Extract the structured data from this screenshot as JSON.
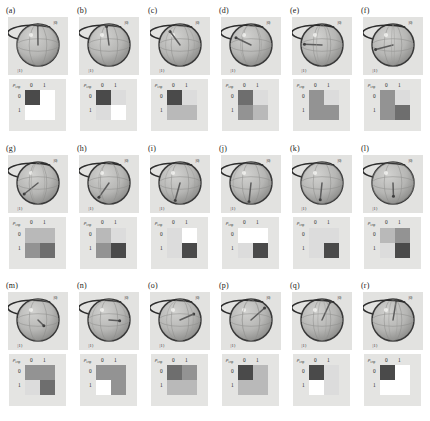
{
  "figure": {
    "type": "qubit-state-tomography-grid",
    "rows": 3,
    "columns": 6,
    "background": "#ffffff",
    "panel_background": "#e2e2e0"
  },
  "axis_labels": {
    "ket_0": "|0⟩",
    "ket_1": "|1⟩",
    "rho_symbol": "ρ",
    "rho_subscript": "exp",
    "col_0": "0",
    "col_1": "1",
    "row_0": "0",
    "row_1": "1"
  },
  "colors": {
    "cell_max": "#4a4a4a",
    "cell_high": "#6e6e6e",
    "cell_mid": "#939393",
    "cell_low": "#b9b9b9",
    "cell_faint": "#dcdcdc",
    "cell_empty": "#ffffff",
    "sphere_fill": "#b4b4b2",
    "sphere_edge": "#3a3a3a",
    "vector": "#5c5c5c",
    "panel_bg": "#e2e2e0",
    "rho_bg": "#e4e4e2"
  },
  "chart_data": {
    "type": "heatmap",
    "title": "",
    "xlabel": "",
    "ylabel": "",
    "categories": [
      "0",
      "1"
    ],
    "panels": [
      {
        "label": "(a)",
        "bloch": {
          "theta_deg": 8,
          "phi_deg": 95,
          "length": 0.96
        },
        "matrix": [
          [
            1.0,
            0.04
          ],
          [
            0.04,
            0.0
          ]
        ]
      },
      {
        "label": "(b)",
        "bloch": {
          "theta_deg": 22,
          "phi_deg": 110,
          "length": 0.95
        },
        "matrix": [
          [
            0.97,
            0.07
          ],
          [
            0.07,
            0.03
          ]
        ]
      },
      {
        "label": "(c)",
        "bloch": {
          "theta_deg": 46,
          "phi_deg": 138,
          "length": 0.93
        },
        "matrix": [
          [
            0.86,
            0.1
          ],
          [
            0.28,
            0.14
          ]
        ]
      },
      {
        "label": "(d)",
        "bloch": {
          "theta_deg": 68,
          "phi_deg": 152,
          "length": 0.92
        },
        "matrix": [
          [
            0.68,
            0.12
          ],
          [
            0.4,
            0.32
          ]
        ]
      },
      {
        "label": "(e)",
        "bloch": {
          "theta_deg": 88,
          "phi_deg": 168,
          "length": 0.9
        },
        "matrix": [
          [
            0.55,
            0.1
          ],
          [
            0.48,
            0.45
          ]
        ]
      },
      {
        "label": "(f)",
        "bloch": {
          "theta_deg": 104,
          "phi_deg": 180,
          "length": 0.9
        },
        "matrix": [
          [
            0.4,
            0.08
          ],
          [
            0.45,
            0.6
          ]
        ]
      },
      {
        "label": "(g)",
        "bloch": {
          "theta_deg": 126,
          "phi_deg": 196,
          "length": 0.89
        },
        "matrix": [
          [
            0.26,
            0.22
          ],
          [
            0.42,
            0.74
          ]
        ]
      },
      {
        "label": "(h)",
        "bloch": {
          "theta_deg": 140,
          "phi_deg": 208,
          "length": 0.89
        },
        "matrix": [
          [
            0.16,
            0.1
          ],
          [
            0.34,
            0.84
          ]
        ]
      },
      {
        "label": "(i)",
        "bloch": {
          "theta_deg": 158,
          "phi_deg": 224,
          "length": 0.9
        },
        "matrix": [
          [
            0.06,
            0.04
          ],
          [
            0.1,
            0.94
          ]
        ]
      },
      {
        "label": "(j)",
        "bloch": {
          "theta_deg": 168,
          "phi_deg": 238,
          "length": 0.91
        },
        "matrix": [
          [
            0.04,
            0.03
          ],
          [
            0.06,
            0.96
          ]
        ]
      },
      {
        "label": "(k)",
        "bloch": {
          "theta_deg": 152,
          "phi_deg": 258,
          "length": 0.9
        },
        "matrix": [
          [
            0.1,
            0.06
          ],
          [
            0.08,
            0.9
          ]
        ]
      },
      {
        "label": "(l)",
        "bloch": {
          "theta_deg": 134,
          "phi_deg": 272,
          "length": 0.9
        },
        "matrix": [
          [
            0.18,
            0.42
          ],
          [
            0.12,
            0.82
          ]
        ]
      },
      {
        "label": "(m)",
        "bloch": {
          "theta_deg": 108,
          "phi_deg": 290,
          "length": 0.9
        },
        "matrix": [
          [
            0.38,
            0.4
          ],
          [
            0.06,
            0.62
          ]
        ]
      },
      {
        "label": "(n)",
        "bloch": {
          "theta_deg": 92,
          "phi_deg": 306,
          "length": 0.91
        },
        "matrix": [
          [
            0.52,
            0.34
          ],
          [
            0.05,
            0.48
          ]
        ]
      },
      {
        "label": "(o)",
        "bloch": {
          "theta_deg": 72,
          "phi_deg": 322,
          "length": 0.92
        },
        "matrix": [
          [
            0.7,
            0.36
          ],
          [
            0.3,
            0.3
          ]
        ]
      },
      {
        "label": "(p)",
        "bloch": {
          "theta_deg": 52,
          "phi_deg": 338,
          "length": 0.93
        },
        "matrix": [
          [
            0.82,
            0.3
          ],
          [
            0.14,
            0.18
          ]
        ]
      },
      {
        "label": "(q)",
        "bloch": {
          "theta_deg": 26,
          "phi_deg": 352,
          "length": 0.95
        },
        "matrix": [
          [
            0.94,
            0.08
          ],
          [
            0.05,
            0.06
          ]
        ]
      },
      {
        "label": "(r)",
        "bloch": {
          "theta_deg": 10,
          "phi_deg": 8,
          "length": 0.96
        },
        "matrix": [
          [
            0.99,
            0.04
          ],
          [
            0.03,
            0.01
          ]
        ]
      }
    ]
  }
}
